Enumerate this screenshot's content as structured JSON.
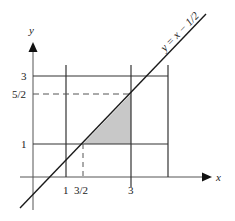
{
  "figure": {
    "axes": {
      "x_label": "x",
      "y_label": "y"
    },
    "line": {
      "label": "y = x − 1/2"
    },
    "x_ticks": [
      "1",
      "3/2",
      "3"
    ],
    "y_ticks": [
      "3",
      "5/2",
      "1"
    ],
    "shaded_region": {
      "description": "triangle bounded by y = x - 1/2, y = 1, x = 3",
      "vertices": [
        [
          1.5,
          1
        ],
        [
          3,
          1
        ],
        [
          3,
          2.5
        ]
      ],
      "fill": "#c8c8c8"
    },
    "grid_lines": {
      "horizontal": [
        1,
        3
      ],
      "vertical": [
        1,
        3,
        4
      ],
      "dashed_horizontal": [
        2.5
      ],
      "dashed_vertical": [
        1.5
      ]
    },
    "colors": {
      "line": "#1a1a1a",
      "grid": "#333333",
      "dashed": "#555555"
    }
  }
}
